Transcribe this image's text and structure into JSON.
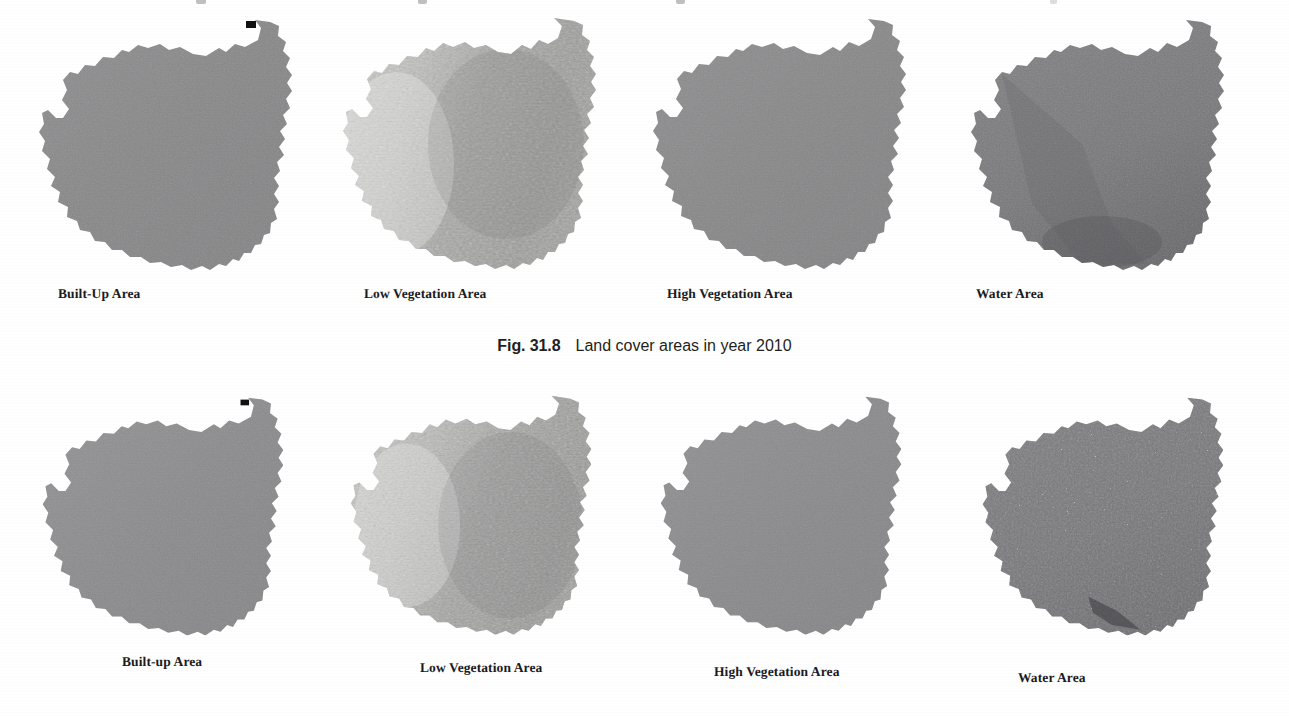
{
  "page": {
    "background_color": "#ffffff",
    "top_clipped_text_remnants": true
  },
  "figure": {
    "caption_number": "Fig. 31.8",
    "caption_text": "Land cover areas in year 2010",
    "rows": [
      {
        "row_id": "row-2010",
        "panels": [
          {
            "label": "Built-Up Area",
            "texture": "uniform-gray",
            "fill": "#8a8a8c"
          },
          {
            "label": "Low Vegetation Area",
            "texture": "mottled-light",
            "fill": "#b4b4b2"
          },
          {
            "label": "High Vegetation Area",
            "texture": "uniform-gray",
            "fill": "#8a8a8c"
          },
          {
            "label": "Water Area",
            "texture": "dark-gray",
            "fill": "#77777a"
          }
        ]
      },
      {
        "row_id": "row-lower",
        "panels": [
          {
            "label": "Built-up Area",
            "texture": "uniform-gray",
            "fill": "#8d8d8f"
          },
          {
            "label": "Low Vegetation Area",
            "texture": "mottled-light",
            "fill": "#b0b0ae"
          },
          {
            "label": "High Vegetation Area",
            "texture": "uniform-gray",
            "fill": "#8b8b8d"
          },
          {
            "label": "Water Area",
            "texture": "speckled-dark",
            "fill": "#707074"
          }
        ]
      }
    ]
  },
  "colors": {
    "ink": "#1b1b1f",
    "caption_ink": "#231f20",
    "paper": "#ffffff",
    "map_mid_gray": "#8a8a8c",
    "map_light_gray": "#b4b4b2",
    "map_dark_gray": "#70707a"
  }
}
